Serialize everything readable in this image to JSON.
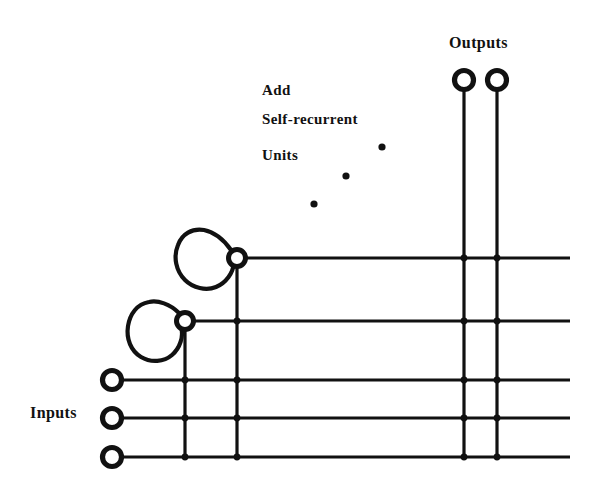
{
  "diagram": {
    "colors": {
      "ink": "#111111",
      "background": "#ffffff"
    },
    "labels": {
      "outputs": "Outputs",
      "inputs": "Inputs",
      "annotation_line1": "Add",
      "annotation_line2": "Self-recurrent",
      "annotation_line3": "Units"
    },
    "geometry": {
      "width": 600,
      "height": 481,
      "horizontal_lines": [
        {
          "name": "hidden-unit-2-row",
          "y": 258,
          "x1": 237,
          "x2": 570
        },
        {
          "name": "hidden-unit-1-row",
          "y": 321,
          "x1": 185,
          "x2": 570
        },
        {
          "name": "input-1-row",
          "y": 380,
          "x1": 112,
          "x2": 570
        },
        {
          "name": "input-2-row",
          "y": 418,
          "x1": 112,
          "x2": 570
        },
        {
          "name": "input-3-row",
          "y": 457,
          "x1": 112,
          "x2": 570
        }
      ],
      "vertical_lines": [
        {
          "name": "hidden-unit-1-column",
          "x": 185,
          "y1": 321,
          "y2": 457
        },
        {
          "name": "hidden-unit-2-column",
          "x": 237,
          "y1": 258,
          "y2": 457
        },
        {
          "name": "output-1-column",
          "x": 464,
          "y1": 80,
          "y2": 457
        },
        {
          "name": "output-2-column",
          "x": 497,
          "y1": 80,
          "y2": 457
        }
      ],
      "output_terminals": [
        {
          "name": "output-terminal-1",
          "cx": 464,
          "cy": 80,
          "r": 9.5
        },
        {
          "name": "output-terminal-2",
          "cx": 497,
          "cy": 80,
          "r": 9.5
        }
      ],
      "input_terminals": [
        {
          "name": "input-terminal-1",
          "cx": 112,
          "cy": 380,
          "r": 9.5
        },
        {
          "name": "input-terminal-2",
          "cx": 112,
          "cy": 418,
          "r": 9.5
        },
        {
          "name": "input-terminal-3",
          "cx": 112,
          "cy": 457,
          "r": 9.5
        }
      ],
      "recurrent_units": [
        {
          "name": "recurrent-unit-1",
          "cx": 185,
          "cy": 321,
          "r": 8.5
        },
        {
          "name": "recurrent-unit-2",
          "cx": 237,
          "cy": 258,
          "r": 8.5
        }
      ],
      "self_loops": [
        {
          "name": "self-loop-1",
          "path": "M 179 313 C 170 304 158 300 149 302 C 137 304 130 314 128 326 C 126 339 131 351 141 357 C 151 363 164 362 172 355 C 180 348 184 336 181 327 Z"
        },
        {
          "name": "self-loop-2",
          "path": "M 231 250 C 224 240 214 232 204 230 C 192 228 182 234 178 245 C 173 257 176 271 185 280 C 193 288 206 291 216 287 C 226 283 233 273 234 263 Z"
        }
      ],
      "ellipsis_dots": [
        {
          "name": "ellipsis-dot-1",
          "cx": 382,
          "cy": 147,
          "r": 3.6
        },
        {
          "name": "ellipsis-dot-2",
          "cx": 346,
          "cy": 176,
          "r": 3.6
        },
        {
          "name": "ellipsis-dot-3",
          "cx": 314,
          "cy": 204,
          "r": 3.6
        }
      ],
      "junctions": [
        {
          "name": "junction-u2col-r2",
          "cx": 237,
          "cy": 321
        },
        {
          "name": "junction-u1col-i1",
          "cx": 185,
          "cy": 380
        },
        {
          "name": "junction-u2col-i1",
          "cx": 237,
          "cy": 380
        },
        {
          "name": "junction-u1col-i2",
          "cx": 185,
          "cy": 418
        },
        {
          "name": "junction-u2col-i2",
          "cx": 237,
          "cy": 418
        },
        {
          "name": "junction-u1col-i3",
          "cx": 185,
          "cy": 457
        },
        {
          "name": "junction-u2col-i3",
          "cx": 237,
          "cy": 457
        },
        {
          "name": "junction-o1col-r1",
          "cx": 464,
          "cy": 258
        },
        {
          "name": "junction-o2col-r1",
          "cx": 497,
          "cy": 258
        },
        {
          "name": "junction-o1col-r2",
          "cx": 464,
          "cy": 321
        },
        {
          "name": "junction-o2col-r2",
          "cx": 497,
          "cy": 321
        },
        {
          "name": "junction-o1col-i1",
          "cx": 464,
          "cy": 380
        },
        {
          "name": "junction-o2col-i1",
          "cx": 497,
          "cy": 380
        },
        {
          "name": "junction-o1col-i2",
          "cx": 464,
          "cy": 418
        },
        {
          "name": "junction-o2col-i2",
          "cx": 497,
          "cy": 418
        },
        {
          "name": "junction-o1col-i3",
          "cx": 464,
          "cy": 457
        },
        {
          "name": "junction-o2col-i3",
          "cx": 497,
          "cy": 457
        }
      ],
      "text_positions": {
        "outputs": {
          "x": 449,
          "y": 48
        },
        "inputs": {
          "x": 30,
          "y": 418
        },
        "annotation_line1": {
          "x": 262,
          "y": 95
        },
        "annotation_line2": {
          "x": 262,
          "y": 124
        },
        "annotation_line3": {
          "x": 262,
          "y": 160
        }
      }
    }
  }
}
